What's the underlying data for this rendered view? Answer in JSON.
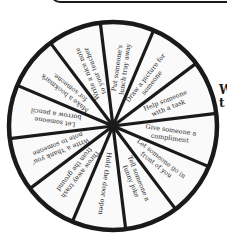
{
  "header_box": {
    "visible": true
  },
  "side_text": {
    "line1": "W",
    "line2": "t"
  },
  "wheel": {
    "center": [
      113,
      126
    ],
    "radius": 104,
    "start_angle": -97,
    "stroke_color": "#1a1a1a",
    "fill_color": "#fafafa",
    "segments": [
      {
        "lines": [
          "Put someone's",
          "lunch tray away"
        ]
      },
      {
        "lines": [
          "Draw a picture for",
          "someone"
        ]
      },
      {
        "lines": [
          "Help someone",
          "with a task"
        ]
      },
      {
        "lines": [
          "Give someone a",
          "compliment"
        ]
      },
      {
        "lines": [
          "Let someone go in",
          "front of you"
        ]
      },
      {
        "lines": [
          "Tell someone a",
          "funny joke"
        ]
      },
      {
        "lines": [
          "Hold the door open"
        ]
      },
      {
        "lines": [
          "Throw away trash",
          "from the ground"
        ]
      },
      {
        "lines": [
          "Write a 'thank you'",
          "note to someone"
        ]
      },
      {
        "lines": [
          "Let someone",
          "borrow a pencil"
        ]
      },
      {
        "lines": [
          "Make a bookmark",
          "for someone."
        ]
      },
      {
        "lines": [
          "Write a nice note",
          "to your teacher"
        ]
      }
    ]
  }
}
